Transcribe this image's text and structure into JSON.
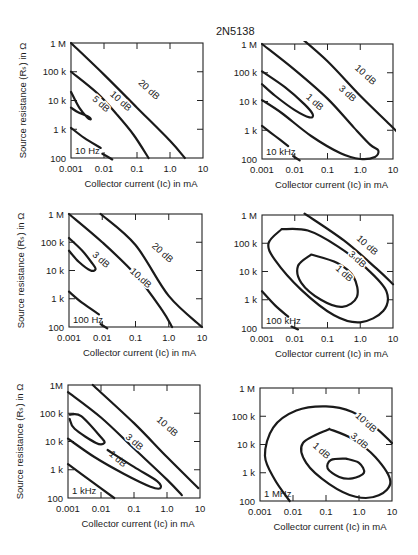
{
  "title": "2N5138",
  "chart_data": [
    {
      "type": "line",
      "subtype": "contour",
      "panel": "top-left",
      "frequency_label": "10 Hz",
      "xlabel": "Collector current (I_C) in mA",
      "ylabel": "Source resistance (R_s) in Ω",
      "xscale": "log",
      "yscale": "log",
      "xlim": [
        0.001,
        10
      ],
      "ylim": [
        100,
        1000000
      ],
      "xticks": [
        "0.001",
        "0.01",
        "0.1",
        "1.0",
        "10"
      ],
      "yticks": [
        "100",
        "1 k",
        "10 k",
        "100 k",
        "1 M"
      ],
      "series": [
        {
          "name": "20 dB",
          "label_at": [
            -0.7,
            4.3
          ],
          "log_points": [
            [
              -3,
              6
            ],
            [
              -2,
              4.9
            ],
            [
              -1,
              3.75
            ],
            [
              0,
              2.6
            ],
            [
              0.45,
              2
            ]
          ]
        },
        {
          "name": "10 dB",
          "label_at": [
            -1.55,
            3.9
          ],
          "log_points": [
            [
              -3,
              5
            ],
            [
              -2.2,
              4.25
            ],
            [
              -1.6,
              3.5
            ],
            [
              -1.1,
              2.8
            ],
            [
              -0.65,
              2
            ]
          ]
        },
        {
          "name": "5 dB",
          "label_at": [
            -2.15,
            3.8
          ],
          "log_points": [
            [
              -3,
              4.3
            ],
            [
              -2.75,
              3.75
            ],
            [
              -2.5,
              3.4
            ],
            [
              -2.4,
              3.35
            ],
            [
              -2.5,
              3.45
            ],
            [
              -2.8,
              3.6
            ],
            [
              -3,
              3.75
            ]
          ]
        },
        {
          "name": "",
          "label_at": null,
          "log_points": [
            [
              -3,
              3.05
            ],
            [
              -2.6,
              2.7
            ],
            [
              -2.1,
              2.35
            ]
          ]
        },
        {
          "name": "",
          "label_at": null,
          "log_points": [
            [
              -2.05,
              2.15
            ],
            [
              -1.75,
              1.95
            ]
          ]
        }
      ]
    },
    {
      "type": "line",
      "subtype": "contour",
      "panel": "top-right",
      "frequency_label": "10 kHz",
      "xlabel": "Collector current (I_C) in mA",
      "ylabel": "",
      "xscale": "log",
      "yscale": "log",
      "xlim": [
        0.001,
        10
      ],
      "ylim": [
        100,
        1000000
      ],
      "xticks": [
        "0.001",
        "0.01",
        "0.1",
        "1.0",
        "10"
      ],
      "yticks": [
        "100",
        "1 k",
        "10 k",
        "100 k",
        "1 M"
      ],
      "series": [
        {
          "name": "10 dB",
          "label_at": [
            0.1,
            4.85
          ],
          "log_points": [
            [
              -1.9,
              6.3
            ],
            [
              -1,
              5.4
            ],
            [
              0,
              4.2
            ],
            [
              0.9,
              3.2
            ],
            [
              1.25,
              2.8
            ]
          ]
        },
        {
          "name": "3 dB",
          "label_at": [
            -0.45,
            4.2
          ],
          "log_points": [
            [
              -3,
              6
            ],
            [
              -2,
              5.1
            ],
            [
              -1,
              4.1
            ],
            [
              -0.2,
              3.1
            ],
            [
              0.3,
              2.5
            ],
            [
              0.55,
              2.3
            ],
            [
              0.45,
              2.07
            ],
            [
              0,
              2
            ],
            [
              -0.6,
              2.2
            ],
            [
              -1.5,
              2.8
            ],
            [
              -2.4,
              3.6
            ],
            [
              -3,
              4.05
            ]
          ]
        },
        {
          "name": "1 dB",
          "label_at": [
            -1.45,
            3.9
          ],
          "log_points": [
            [
              -3,
              5.05
            ],
            [
              -2.3,
              4.5
            ],
            [
              -1.7,
              3.9
            ],
            [
              -1.45,
              3.55
            ],
            [
              -1.55,
              3.45
            ],
            [
              -2,
              3.7
            ],
            [
              -2.6,
              4.2
            ],
            [
              -3,
              4.6
            ]
          ]
        },
        {
          "name": "",
          "label_at": null,
          "log_points": [
            [
              -3,
              3.15
            ],
            [
              -2.6,
              2.8
            ],
            [
              -2.2,
              2.45
            ]
          ]
        },
        {
          "name": "",
          "label_at": null,
          "log_points": [
            [
              -2.05,
              2.1
            ],
            [
              -1.85,
              1.95
            ]
          ]
        }
      ]
    },
    {
      "type": "line",
      "subtype": "contour",
      "panel": "middle-left",
      "frequency_label": "100 Hz",
      "xlabel": "Collector current (I_C) in mA",
      "ylabel": "Source resistance (R_s) in Ω",
      "xscale": "log",
      "yscale": "log",
      "xlim": [
        0.001,
        10
      ],
      "ylim": [
        100,
        1000000
      ],
      "xticks": [
        "0.001",
        "0.01",
        "0.1",
        "1.0",
        "10"
      ],
      "yticks": [
        "100",
        "1 k",
        "10 k",
        "100 k",
        "1 M"
      ],
      "series": [
        {
          "name": "20 dB",
          "label_at": [
            -0.25,
            4.55
          ],
          "log_points": [
            [
              -2.05,
              6
            ],
            [
              -1,
              4.9
            ],
            [
              0,
              3.1
            ],
            [
              1,
              2
            ]
          ]
        },
        {
          "name": "10 dB",
          "label_at": [
            -0.9,
            3.65
          ],
          "log_points": [
            [
              -3,
              6
            ],
            [
              -2,
              5
            ],
            [
              -1,
              3.85
            ],
            [
              -0.2,
              2.6
            ],
            [
              0.1,
              2
            ]
          ]
        },
        {
          "name": "3 dB",
          "label_at": [
            -2.1,
            4.3
          ],
          "log_points": [
            [
              -3,
              5.15
            ],
            [
              -2.6,
              4.7
            ],
            [
              -2.3,
              4.25
            ],
            [
              -2.2,
              4.05
            ],
            [
              -2.35,
              4.0
            ],
            [
              -2.7,
              4.3
            ],
            [
              -3,
              4.7
            ]
          ]
        },
        {
          "name": "",
          "label_at": null,
          "log_points": [
            [
              -3,
              3.25
            ],
            [
              -2.6,
              2.85
            ],
            [
              -2.1,
              2.45
            ]
          ]
        },
        {
          "name": "",
          "label_at": null,
          "log_points": [
            [
              -2.05,
              2.1
            ],
            [
              -1.85,
              1.95
            ]
          ]
        }
      ]
    },
    {
      "type": "line",
      "subtype": "contour",
      "panel": "middle-right",
      "frequency_label": "100 kHz",
      "xlabel": "Collector current (I_C) in mA",
      "ylabel": "",
      "xscale": "log",
      "yscale": "log",
      "xlim": [
        0.001,
        10
      ],
      "ylim": [
        100,
        1000000
      ],
      "xticks": [
        "0.001",
        "0.01",
        "0.1",
        "1.0",
        "10"
      ],
      "yticks": [
        "100",
        "1 k",
        "10 k",
        "100 k",
        "1 M"
      ],
      "series": [
        {
          "name": "10 dB",
          "label_at": [
            0.15,
            4.85
          ],
          "log_points": [
            [
              -1.7,
              6.05
            ],
            [
              -0.5,
              5.1
            ],
            [
              0.5,
              4.1
            ],
            [
              1,
              3.55
            ]
          ]
        },
        {
          "name": "3 dB",
          "label_at": [
            -0.15,
            4.35
          ],
          "log_points": [
            [
              -2.4,
              5.5
            ],
            [
              -1.6,
              5.45
            ],
            [
              -0.7,
              4.9
            ],
            [
              0.2,
              4.1
            ],
            [
              0.8,
              3.3
            ],
            [
              0.7,
              2.6
            ],
            [
              0,
              2.2
            ],
            [
              -0.8,
              2.45
            ],
            [
              -1.8,
              3.35
            ],
            [
              -2.6,
              4.4
            ],
            [
              -2.8,
              5
            ],
            [
              -2.4,
              5.5
            ]
          ]
        },
        {
          "name": "1 dB",
          "label_at": [
            -0.55,
            3.85
          ],
          "log_points": [
            [
              -1.5,
              4.6
            ],
            [
              -0.7,
              4.3
            ],
            [
              -0.2,
              3.8
            ],
            [
              -0.1,
              3.1
            ],
            [
              -0.55,
              2.75
            ],
            [
              -1.2,
              3
            ],
            [
              -1.8,
              3.6
            ],
            [
              -1.9,
              4.2
            ],
            [
              -1.5,
              4.6
            ]
          ]
        },
        {
          "name": "",
          "label_at": null,
          "log_points": [
            [
              -3,
              3.3
            ],
            [
              -2.6,
              2.8
            ],
            [
              -2.2,
              2.4
            ]
          ]
        },
        {
          "name": "",
          "label_at": null,
          "log_points": [
            [
              -2.1,
              2.05
            ],
            [
              -1.9,
              1.95
            ]
          ]
        }
      ]
    },
    {
      "type": "line",
      "subtype": "contour",
      "panel": "bottom-left",
      "frequency_label": "1 kHz",
      "xlabel": "Collector current (I_C) in mA",
      "ylabel": "Source resistance (R_s) in Ω",
      "xscale": "log",
      "yscale": "log",
      "xlim": [
        0.001,
        10
      ],
      "ylim": [
        100,
        1000000
      ],
      "xticks": [
        "0.001",
        "0.01",
        "0.1",
        "1.0",
        "10"
      ],
      "yticks": [
        "100",
        "1M",
        "1 k",
        "10 k",
        "100 k"
      ],
      "ytick_order": [
        "100",
        "1 k",
        "10 k",
        "100 k",
        "1M"
      ],
      "series": [
        {
          "name": "10 dB",
          "label_at": [
            -0.05,
            4.45
          ],
          "log_points": [
            [
              -2.25,
              6
            ],
            [
              -1,
              4.65
            ],
            [
              0,
              3.45
            ],
            [
              0.95,
              2.35
            ]
          ]
        },
        {
          "name": "3 dB",
          "label_at": [
            -1.05,
            3.9
          ],
          "log_points": [
            [
              -3,
              5.75
            ],
            [
              -2,
              4.85
            ],
            [
              -1,
              3.75
            ],
            [
              0,
              2.65
            ],
            [
              0.45,
              2.1
            ]
          ]
        },
        {
          "name": "1 dB",
          "label_at": [
            -1.55,
            3.3
          ],
          "log_points": [
            [
              -2.95,
              4.95
            ],
            [
              -2.6,
              4.9
            ],
            [
              -2,
              4.15
            ],
            [
              -1.9,
              3.95
            ],
            [
              -2.15,
              3.95
            ],
            [
              -2.8,
              4.45
            ],
            [
              -2.95,
              4.8
            ]
          ]
        },
        {
          "name": "",
          "label_at": null,
          "log_points": [
            [
              -3,
              4.1
            ],
            [
              -2.2,
              3.45
            ],
            [
              -1.3,
              2.85
            ],
            [
              -0.5,
              2.4
            ],
            [
              -0.2,
              2.35
            ],
            [
              -0.3,
              2.6
            ],
            [
              -1,
              3.1
            ],
            [
              -1.8,
              3.7
            ]
          ]
        },
        {
          "name": "",
          "label_at": null,
          "log_points": [
            [
              -3,
              3.2
            ],
            [
              -2.3,
              2.6
            ],
            [
              -1.6,
              2
            ]
          ]
        }
      ]
    },
    {
      "type": "line",
      "subtype": "contour",
      "panel": "bottom-right",
      "frequency_label": "1 MHz",
      "xlabel": "Collector current (I_C) in mA",
      "ylabel": "",
      "xscale": "log",
      "yscale": "log",
      "xlim": [
        0.001,
        10
      ],
      "ylim": [
        100,
        1000000
      ],
      "xticks": [
        "0.001",
        "0.01",
        "0.1",
        "1.0",
        "10"
      ],
      "yticks": [
        "100",
        "1 k",
        "10 k",
        "100 k",
        "1 M"
      ],
      "series": [
        {
          "name": "10 dB",
          "label_at": [
            0.15,
            4.7
          ],
          "log_points": [
            [
              1,
              4.05
            ],
            [
              0.5,
              4.6
            ],
            [
              -0.2,
              5.15
            ],
            [
              -1,
              5.35
            ],
            [
              -1.9,
              5.2
            ],
            [
              -2.6,
              4.6
            ],
            [
              -2.85,
              3.6
            ],
            [
              -2.55,
              2.75
            ],
            [
              -2.1,
              2
            ]
          ]
        },
        {
          "name": "3 dB",
          "label_at": [
            -0.05,
            4.05
          ],
          "log_points": [
            [
              -0.9,
              4.55
            ],
            [
              -0.2,
              4.2
            ],
            [
              0.5,
              3.55
            ],
            [
              0.95,
              2.7
            ],
            [
              0.6,
              2.2
            ],
            [
              -0.1,
              2.15
            ],
            [
              -0.9,
              2.6
            ],
            [
              -1.6,
              3.35
            ],
            [
              -1.7,
              4.05
            ],
            [
              -0.9,
              4.55
            ]
          ]
        },
        {
          "name": "1 dB",
          "label_at": [
            -1.2,
            3.7
          ],
          "log_points": [
            [
              -0.4,
              3.5
            ],
            [
              0,
              3.35
            ],
            [
              0.15,
              3
            ],
            [
              -0.2,
              2.8
            ],
            [
              -0.6,
              2.85
            ],
            [
              -0.95,
              3.15
            ],
            [
              -0.85,
              3.45
            ],
            [
              -0.4,
              3.5
            ]
          ]
        }
      ]
    }
  ]
}
